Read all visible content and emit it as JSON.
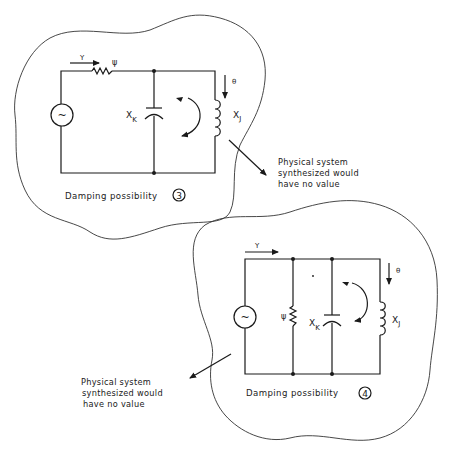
{
  "diagrams": [
    {
      "id": "damping-3",
      "caption": "Damping possibility",
      "number": "3",
      "labels": {
        "flow_in": "Y",
        "resistor": "ψ",
        "capacitor_main": "X",
        "capacitor_sub": "K",
        "inductor_main": "X",
        "inductor_sub": "J",
        "flow_out": "θ",
        "source": "~"
      },
      "note": [
        "Physical system",
        "synthesized would",
        "have no value"
      ]
    },
    {
      "id": "damping-4",
      "caption": "Damping possibility",
      "number": "4",
      "labels": {
        "flow_in": "Y",
        "resistor": "ψ",
        "capacitor_main": "X",
        "capacitor_sub": "K",
        "inductor_main": "X",
        "inductor_sub": "J",
        "flow_out": "θ",
        "source": "~"
      },
      "note": [
        "Physical system",
        "synthesized would",
        "have no value"
      ]
    }
  ],
  "colors": {
    "ink": "#1a1a1a",
    "background": "#ffffff"
  }
}
